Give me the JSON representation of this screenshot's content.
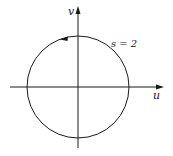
{
  "diagram": {
    "axes": {
      "horizontal_label": "u",
      "vertical_label": "v"
    },
    "curve": {
      "type": "circle",
      "label": "s = 2",
      "orientation": "counterclockwise"
    },
    "colors": {
      "stroke": "#1a1a1a",
      "background": "#ffffff"
    }
  }
}
